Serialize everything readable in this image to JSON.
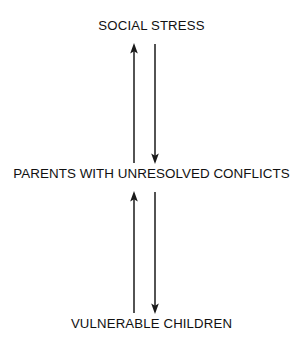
{
  "diagram": {
    "type": "cyclic-influence-diagram",
    "background_color": "#ffffff",
    "line_color": "#1a1a1a",
    "text_color": "#111111",
    "nodes": [
      {
        "id": "top",
        "label": "SOCIAL STRESS"
      },
      {
        "id": "middle",
        "label": "PARENTS WITH UNRESOLVED CONFLICTS"
      },
      {
        "id": "bottom",
        "label": "VULNERABLE CHILDREN"
      }
    ],
    "arrows": [
      {
        "id": "middle-to-top",
        "from": "middle",
        "to": "top",
        "direction": "up",
        "x": 134,
        "y_start": 163,
        "y_end": 44
      },
      {
        "id": "top-to-middle",
        "from": "top",
        "to": "middle",
        "direction": "down",
        "x": 155,
        "y_start": 44,
        "y_end": 163
      },
      {
        "id": "bottom-to-middle",
        "from": "bottom",
        "to": "middle",
        "direction": "up",
        "x": 134,
        "y_start": 313,
        "y_end": 192
      },
      {
        "id": "middle-to-bottom",
        "from": "middle",
        "to": "bottom",
        "direction": "down",
        "x": 155,
        "y_start": 192,
        "y_end": 313
      }
    ]
  }
}
